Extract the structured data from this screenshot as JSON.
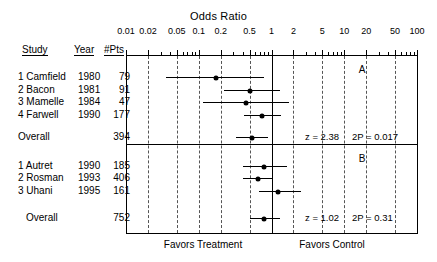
{
  "chart_data": {
    "type": "forest",
    "title": "Odds Ratio",
    "xlabel": "Odds Ratio",
    "ylabel": "",
    "scale": "log",
    "xlim": [
      0.01,
      100
    ],
    "grid": true,
    "null_value": 1,
    "tick_labels": [
      "0.01",
      "0.02",
      "0.05",
      "0.1",
      "0.2",
      "0.5",
      "1",
      "2",
      "5",
      "10",
      "20",
      "50",
      "100"
    ],
    "tick_values": [
      0.01,
      0.02,
      0.05,
      0.1,
      0.2,
      0.5,
      1,
      2,
      5,
      10,
      20,
      50,
      100
    ],
    "gridline_values": [
      0.02,
      0.05,
      0.1,
      0.2,
      0.5,
      2,
      5,
      10,
      20,
      50
    ],
    "columns": [
      "Study",
      "Year",
      "#Pts"
    ],
    "footer_left": "Favors Treatment",
    "footer_right": "Favors Control",
    "panels": [
      {
        "letter": "A",
        "rows": [
          {
            "study": "1 Camfield",
            "year": "1980",
            "pts": "79",
            "or": 0.17,
            "lo": 0.035,
            "hi": 0.8
          },
          {
            "study": "2 Bacon",
            "year": "1981",
            "pts": "91",
            "or": 0.5,
            "lo": 0.22,
            "hi": 1.3
          },
          {
            "study": "3 Mamelle",
            "year": "1984",
            "pts": "47",
            "or": 0.45,
            "lo": 0.115,
            "hi": 1.75
          },
          {
            "study": "4 Farwell",
            "year": "1990",
            "pts": "177",
            "or": 0.75,
            "lo": 0.42,
            "hi": 1.35
          }
        ],
        "overall": {
          "label": "Overall",
          "pts": "394",
          "or": 0.54,
          "lo": 0.33,
          "hi": 0.9,
          "z": "z = 2.38",
          "p": "2P = 0.017"
        }
      },
      {
        "letter": "B",
        "rows": [
          {
            "study": "1 Autret",
            "year": "1990",
            "pts": "185",
            "or": 0.78,
            "lo": 0.4,
            "hi": 1.62
          },
          {
            "study": "2 Rosman",
            "year": "1993",
            "pts": "406",
            "or": 0.66,
            "lo": 0.4,
            "hi": 1.02
          },
          {
            "study": "3 Uhani",
            "year": "1995",
            "pts": "161",
            "or": 1.22,
            "lo": 0.68,
            "hi": 2.55
          }
        ],
        "overall": {
          "label": "Overall",
          "pts": "752",
          "or": 0.79,
          "lo": 0.5,
          "hi": 1.3,
          "z": "z = 1.02",
          "p": "2P = 0.31"
        }
      }
    ]
  }
}
